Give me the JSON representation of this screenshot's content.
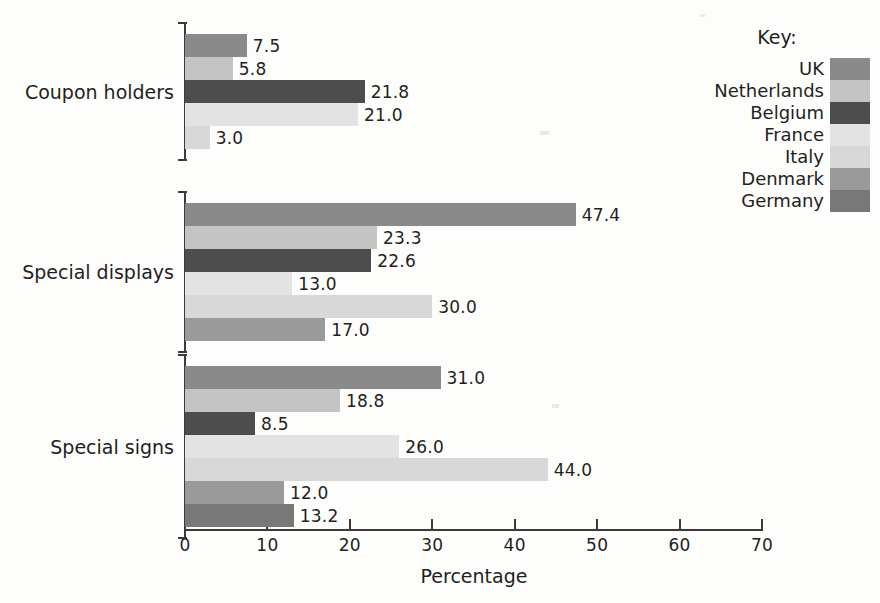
{
  "chart_data": {
    "type": "bar",
    "orientation": "horizontal",
    "title": "",
    "xlabel": "Percentage",
    "ylabel": "",
    "xlim": [
      0,
      70
    ],
    "xticks": [
      0,
      10,
      20,
      30,
      40,
      50,
      60,
      70
    ],
    "xtick_labels": [
      "0",
      "10",
      "20",
      "30",
      "40",
      "50",
      "60",
      "70"
    ],
    "grid": false,
    "legend_position": "top-right",
    "legend_title": "Key:",
    "categories": [
      "Coupon holders",
      "Special displays",
      "Special signs"
    ],
    "series": [
      {
        "name": "UK",
        "color": "#8a8a8a",
        "values": [
          7.5,
          47.4,
          31.0
        ]
      },
      {
        "name": "Netherlands",
        "color": "#c4c4c4",
        "values": [
          5.8,
          23.3,
          18.8
        ]
      },
      {
        "name": "Belgium",
        "color": "#4d4d4d",
        "values": [
          21.8,
          22.6,
          8.5
        ]
      },
      {
        "name": "France",
        "color": "#e3e3e3",
        "values": [
          21.0,
          13.0,
          26.0
        ]
      },
      {
        "name": "Italy",
        "color": "#d8d8d8",
        "values": [
          3.0,
          30.0,
          44.0
        ]
      },
      {
        "name": "Denmark",
        "color": "#9a9a9a",
        "values": [
          null,
          17.0,
          12.0
        ]
      },
      {
        "name": "Germany",
        "color": "#787878",
        "values": [
          null,
          null,
          13.2
        ]
      }
    ],
    "groups": [
      {
        "category": "Coupon holders",
        "bars": [
          {
            "series": "UK",
            "value": 7.5,
            "label": "7.5",
            "color": "#8a8a8a"
          },
          {
            "series": "Netherlands",
            "value": 5.8,
            "label": "5.8",
            "color": "#c4c4c4"
          },
          {
            "series": "Belgium",
            "value": 21.8,
            "label": "21.8",
            "color": "#4d4d4d"
          },
          {
            "series": "France",
            "value": 21.0,
            "label": "21.0",
            "color": "#e3e3e3"
          },
          {
            "series": "Italy",
            "value": 3.0,
            "label": "3.0",
            "color": "#d8d8d8"
          }
        ]
      },
      {
        "category": "Special displays",
        "bars": [
          {
            "series": "UK",
            "value": 47.4,
            "label": "47.4",
            "color": "#8a8a8a"
          },
          {
            "series": "Netherlands",
            "value": 23.3,
            "label": "23.3",
            "color": "#c4c4c4"
          },
          {
            "series": "Belgium",
            "value": 22.6,
            "label": "22.6",
            "color": "#4d4d4d"
          },
          {
            "series": "France",
            "value": 13.0,
            "label": "13.0",
            "color": "#e3e3e3"
          },
          {
            "series": "Italy",
            "value": 30.0,
            "label": "30.0",
            "color": "#d8d8d8"
          },
          {
            "series": "Denmark",
            "value": 17.0,
            "label": "17.0",
            "color": "#9a9a9a"
          }
        ]
      },
      {
        "category": "Special signs",
        "bars": [
          {
            "series": "UK",
            "value": 31.0,
            "label": "31.0",
            "color": "#8a8a8a"
          },
          {
            "series": "Netherlands",
            "value": 18.8,
            "label": "18.8",
            "color": "#c4c4c4"
          },
          {
            "series": "Belgium",
            "value": 8.5,
            "label": "8.5",
            "color": "#4d4d4d"
          },
          {
            "series": "France",
            "value": 26.0,
            "label": "26.0",
            "color": "#e3e3e3"
          },
          {
            "series": "Italy",
            "value": 44.0,
            "label": "44.0",
            "color": "#d8d8d8"
          },
          {
            "series": "Denmark",
            "value": 12.0,
            "label": "12.0",
            "color": "#9a9a9a"
          },
          {
            "series": "Germany",
            "value": 13.2,
            "label": "13.2",
            "color": "#787878"
          }
        ]
      }
    ]
  },
  "legend": {
    "title": "Key:",
    "items": [
      {
        "label": "UK",
        "color": "#8a8a8a"
      },
      {
        "label": "Netherlands",
        "color": "#c4c4c4"
      },
      {
        "label": "Belgium",
        "color": "#4d4d4d"
      },
      {
        "label": "France",
        "color": "#e3e3e3"
      },
      {
        "label": "Italy",
        "color": "#d8d8d8"
      },
      {
        "label": "Denmark",
        "color": "#9a9a9a"
      },
      {
        "label": "Germany",
        "color": "#787878"
      }
    ]
  },
  "axis": {
    "x_title": "Percentage"
  }
}
